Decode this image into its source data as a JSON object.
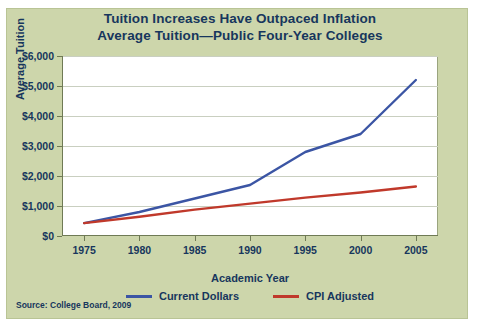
{
  "title": {
    "line1": "Tuition Increases Have Outpaced Inflation",
    "line2": "Average Tuition—Public Four-Year Colleges"
  },
  "source": "Source: College Board, 2009",
  "colors": {
    "panel_background": "#cdd6ab",
    "plot_background": "#ffffff",
    "text": "#17365d",
    "current_dollars": "#3b55a4",
    "cpi_adjusted": "#c0392b"
  },
  "chart_data": {
    "type": "line",
    "xlabel": "Academic Year",
    "ylabel": "Average Tuition",
    "x": [
      1975,
      1980,
      1985,
      1990,
      1995,
      2000,
      2005
    ],
    "xticklabels": [
      "1975",
      "1980",
      "1985",
      "1990",
      "1995",
      "2000",
      "2005"
    ],
    "yticklabels": [
      "$0",
      "$1,000",
      "$2,000",
      "$3,000",
      "$4,000",
      "$5,000",
      "$6,000"
    ],
    "yticks": [
      0,
      1000,
      2000,
      3000,
      4000,
      5000,
      6000
    ],
    "ylim": [
      0,
      6000
    ],
    "xlim": [
      1973,
      2007
    ],
    "grid": true,
    "legend_position": "bottom",
    "series": [
      {
        "name": "Current Dollars",
        "color": "#3b55a4",
        "values": [
          430,
          800,
          1250,
          1700,
          2800,
          3400,
          5200
        ]
      },
      {
        "name": "CPI Adjusted",
        "color": "#c0392b",
        "values": [
          430,
          640,
          880,
          1080,
          1280,
          1450,
          1650
        ]
      }
    ]
  },
  "legend": [
    {
      "label": "Current Dollars",
      "color": "#3b55a4"
    },
    {
      "label": "CPI Adjusted",
      "color": "#c0392b"
    }
  ]
}
